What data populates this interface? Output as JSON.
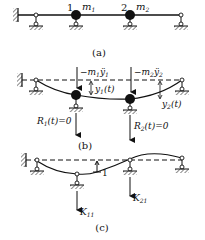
{
  "panels": {
    "a": {
      "caption": "(a)",
      "node_labels": [
        "1",
        "2"
      ],
      "mass_labels": [
        "m",
        "m"
      ],
      "mass_subscripts": [
        "1",
        "2"
      ]
    },
    "b": {
      "caption": "(b)",
      "inertia_force_1": "−m",
      "inertia_force_1_sub": "1",
      "inertia_force_1_acc": "ÿ",
      "inertia_force_1_acc_sub": "1",
      "inertia_force_2": "−m",
      "inertia_force_2_sub": "2",
      "inertia_force_2_acc": "ÿ",
      "inertia_force_2_acc_sub": "2",
      "disp_1": "y",
      "disp_1_sub": "1",
      "disp_1_arg": "(t)",
      "disp_2": "y",
      "disp_2_sub": "2",
      "disp_2_arg": "(t)",
      "reaction_1": "R",
      "reaction_1_sub": "1",
      "reaction_1_rest": "(t)=0",
      "reaction_2": "R",
      "reaction_2_sub": "2",
      "reaction_2_rest": "(t)=0"
    },
    "c": {
      "caption": "(c)",
      "unit_disp": "1",
      "k11": "K",
      "k11_sub": "11",
      "k21": "K",
      "k21_sub": "21"
    }
  },
  "colors": {
    "ink": "#111111",
    "background": "#ffffff"
  }
}
